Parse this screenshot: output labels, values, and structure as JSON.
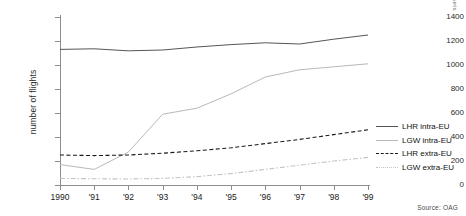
{
  "chart_data": {
    "type": "line",
    "title": "",
    "xlabel": "",
    "ylabel": "number of flights",
    "x": [
      "1990",
      "'91",
      "'92",
      "'93",
      "'94",
      "'95",
      "'96",
      "'97",
      "'98",
      "'99"
    ],
    "x_values": [
      1990,
      1991,
      1992,
      1993,
      1994,
      1995,
      1996,
      1997,
      1998,
      1999
    ],
    "ylim": [
      0,
      1400
    ],
    "yticks": [
      0,
      200,
      400,
      600,
      800,
      1000,
      1200,
      1400
    ],
    "grid": false,
    "legend_position": "right",
    "source": "Source: OAG",
    "series": [
      {
        "name": "LHR intra-EU",
        "style": "solid",
        "color": "#555555",
        "values": [
          1130,
          1135,
          1118,
          1125,
          1150,
          1170,
          1185,
          1175,
          1215,
          1250
        ]
      },
      {
        "name": "LGW intra-EU",
        "style": "solid",
        "color": "#b9b9b9",
        "values": [
          170,
          130,
          275,
          590,
          640,
          760,
          900,
          960,
          985,
          1010
        ]
      },
      {
        "name": "LHR extra-EU",
        "style": "dashed",
        "color": "#1a1a1a",
        "values": [
          250,
          245,
          250,
          265,
          285,
          310,
          345,
          380,
          420,
          460
        ]
      },
      {
        "name": "LGW extra-EU",
        "style": "dashdot",
        "color": "#c4c4c4",
        "values": [
          55,
          52,
          50,
          55,
          70,
          95,
          130,
          165,
          200,
          230
        ]
      }
    ]
  },
  "top_strip": {
    "text": ""
  },
  "corner_mark": {
    "text": "sets"
  }
}
